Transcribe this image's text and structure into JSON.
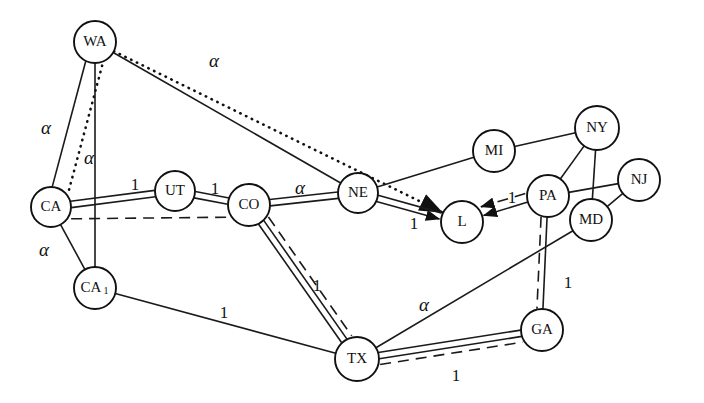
{
  "figure": {
    "kind": "network-graph",
    "background_color": "#ffffff",
    "line_color": "#111111",
    "node_fill": "#ffffff",
    "width": 704,
    "height": 403
  },
  "nodes": [
    {
      "id": "WA",
      "label": "WA",
      "sub": "",
      "x": 95,
      "y": 42,
      "r": 21
    },
    {
      "id": "CA",
      "label": "CA",
      "sub": "",
      "x": 51,
      "y": 207,
      "r": 20
    },
    {
      "id": "CA1",
      "label": "CA",
      "sub": "1",
      "x": 95,
      "y": 288,
      "r": 21
    },
    {
      "id": "UT",
      "label": "UT",
      "sub": "",
      "x": 175,
      "y": 191,
      "r": 20
    },
    {
      "id": "CO",
      "label": "CO",
      "sub": "",
      "x": 249,
      "y": 205,
      "r": 21
    },
    {
      "id": "NE",
      "label": "NE",
      "sub": "",
      "x": 358,
      "y": 193,
      "r": 20
    },
    {
      "id": "L",
      "label": "L",
      "sub": "",
      "x": 462,
      "y": 222,
      "r": 21
    },
    {
      "id": "MI",
      "label": "MI",
      "sub": "",
      "x": 494,
      "y": 151,
      "r": 21
    },
    {
      "id": "NY",
      "label": "NY",
      "sub": "",
      "x": 597,
      "y": 128,
      "r": 22
    },
    {
      "id": "PA",
      "label": "PA",
      "sub": "",
      "x": 548,
      "y": 196,
      "r": 21
    },
    {
      "id": "NJ",
      "label": "NJ",
      "sub": "",
      "x": 639,
      "y": 180,
      "r": 21
    },
    {
      "id": "MD",
      "label": "MD",
      "sub": "",
      "x": 591,
      "y": 220,
      "r": 21
    },
    {
      "id": "TX",
      "label": "TX",
      "sub": "",
      "x": 357,
      "y": 359,
      "r": 22
    },
    {
      "id": "GA",
      "label": "GA",
      "sub": "",
      "x": 542,
      "y": 330,
      "r": 21
    }
  ],
  "edge_labels": [
    {
      "id": "lbl-wa-l",
      "text": "α",
      "x": 214,
      "y": 63,
      "kind": "alpha"
    },
    {
      "id": "lbl-wa-ca-d",
      "text": "α",
      "x": 46,
      "y": 130,
      "kind": "alpha"
    },
    {
      "id": "lbl-wa-ca1",
      "text": "α",
      "x": 89,
      "y": 160,
      "kind": "alpha"
    },
    {
      "id": "lbl-ca-ut",
      "text": "1",
      "x": 135,
      "y": 186,
      "kind": "num"
    },
    {
      "id": "lbl-ut-co",
      "text": "1",
      "x": 215,
      "y": 190,
      "kind": "num"
    },
    {
      "id": "lbl-co-ne",
      "text": "α",
      "x": 300,
      "y": 190,
      "kind": "alpha"
    },
    {
      "id": "lbl-ne-l",
      "text": "1",
      "x": 414,
      "y": 225,
      "kind": "num"
    },
    {
      "id": "lbl-ca-ca1",
      "text": "α",
      "x": 44,
      "y": 252,
      "kind": "alpha"
    },
    {
      "id": "lbl-ca1-tx",
      "text": "1",
      "x": 224,
      "y": 314,
      "kind": "num"
    },
    {
      "id": "lbl-co-tx",
      "text": "1",
      "x": 317,
      "y": 287,
      "kind": "num"
    },
    {
      "id": "lbl-pa-l",
      "text": "1",
      "x": 512,
      "y": 199,
      "kind": "num"
    },
    {
      "id": "lbl-tx-md",
      "text": "α",
      "x": 424,
      "y": 307,
      "kind": "alpha"
    },
    {
      "id": "lbl-pa-ga",
      "text": "1",
      "x": 568,
      "y": 284,
      "kind": "num"
    },
    {
      "id": "lbl-tx-ga",
      "text": "1",
      "x": 456,
      "y": 377,
      "kind": "num"
    }
  ],
  "edges": [
    {
      "id": "wa-l-dotted",
      "from": "WA",
      "to": "L",
      "style": "dotted",
      "arrow": true,
      "label": "α"
    },
    {
      "id": "wa-ca-dotted",
      "from": "WA",
      "to": "CA",
      "style": "dotted",
      "arrow": false,
      "label": "α"
    },
    {
      "id": "wa-ca-solid",
      "from": "WA",
      "to": "CA",
      "style": "solid",
      "arrow": false,
      "label": ""
    },
    {
      "id": "wa-ca1",
      "from": "WA",
      "to": "CA1",
      "style": "solid",
      "arrow": false,
      "label": "α"
    },
    {
      "id": "wa-ne",
      "from": "WA",
      "to": "NE",
      "style": "solid",
      "arrow": false,
      "label": ""
    },
    {
      "id": "ca-ut",
      "from": "CA",
      "to": "UT",
      "style": "double",
      "arrow": false,
      "label": "1"
    },
    {
      "id": "ut-co",
      "from": "UT",
      "to": "CO",
      "style": "double",
      "arrow": false,
      "label": "1"
    },
    {
      "id": "co-ne",
      "from": "CO",
      "to": "NE",
      "style": "double",
      "arrow": false,
      "label": "α"
    },
    {
      "id": "ne-l",
      "from": "NE",
      "to": "L",
      "style": "double",
      "arrow": true,
      "label": "1"
    },
    {
      "id": "ca-co-dashed",
      "from": "CA",
      "to": "CO",
      "style": "dashed",
      "arrow": false,
      "label": ""
    },
    {
      "id": "co-tx-dashed",
      "from": "CO",
      "to": "TX",
      "style": "dashed",
      "arrow": false,
      "label": ""
    },
    {
      "id": "ca-ca1",
      "from": "CA",
      "to": "CA1",
      "style": "solid",
      "arrow": false,
      "label": "α"
    },
    {
      "id": "ca1-tx",
      "from": "CA1",
      "to": "TX",
      "style": "solid",
      "arrow": false,
      "label": "1"
    },
    {
      "id": "co-tx",
      "from": "CO",
      "to": "TX",
      "style": "double",
      "arrow": false,
      "label": "1"
    },
    {
      "id": "mi-ne",
      "from": "MI",
      "to": "NE",
      "style": "solid",
      "arrow": false,
      "label": ""
    },
    {
      "id": "mi-ny",
      "from": "MI",
      "to": "NY",
      "style": "solid",
      "arrow": false,
      "label": ""
    },
    {
      "id": "ny-pa",
      "from": "NY",
      "to": "PA",
      "style": "solid",
      "arrow": false,
      "label": ""
    },
    {
      "id": "ny-md",
      "from": "NY",
      "to": "MD",
      "style": "solid",
      "arrow": false,
      "label": ""
    },
    {
      "id": "pa-nj",
      "from": "PA",
      "to": "NJ",
      "style": "solid",
      "arrow": false,
      "label": ""
    },
    {
      "id": "nj-md",
      "from": "NJ",
      "to": "MD",
      "style": "solid",
      "arrow": false,
      "label": ""
    },
    {
      "id": "pa-l",
      "from": "PA",
      "to": "L",
      "style": "solid",
      "arrow": true,
      "label": "1"
    },
    {
      "id": "pa-l-dashed",
      "from": "PA",
      "to": "L",
      "style": "dashed",
      "arrow": true,
      "label": ""
    },
    {
      "id": "pa-ga",
      "from": "PA",
      "to": "GA",
      "style": "solid",
      "arrow": false,
      "label": "1"
    },
    {
      "id": "pa-ga-dashed",
      "from": "PA",
      "to": "GA",
      "style": "dashed",
      "arrow": false,
      "label": ""
    },
    {
      "id": "tx-md",
      "from": "TX",
      "to": "MD",
      "style": "solid",
      "arrow": false,
      "label": "α"
    },
    {
      "id": "tx-ga",
      "from": "TX",
      "to": "GA",
      "style": "double",
      "arrow": false,
      "label": "1"
    },
    {
      "id": "tx-ga-dashed",
      "from": "TX",
      "to": "GA",
      "style": "dashed",
      "arrow": false,
      "label": ""
    }
  ]
}
